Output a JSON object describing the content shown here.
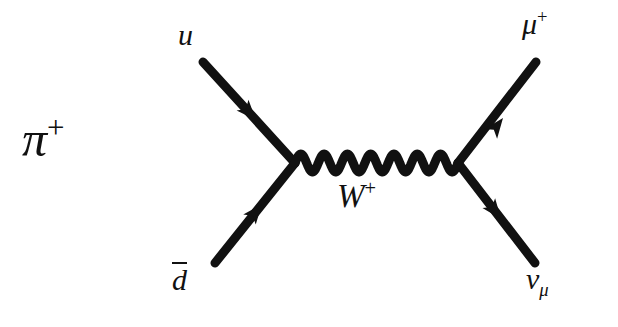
{
  "diagram": {
    "background_color": "#ffffff",
    "stroke_color": "#111111",
    "labels": {
      "pion": {
        "base": "π",
        "superscript": "+"
      },
      "up_quark": {
        "base": "u",
        "superscript": ""
      },
      "anti_down_quark": {
        "base": "d",
        "overline": true
      },
      "w_boson": {
        "base": "W",
        "superscript": "+"
      },
      "antimuon": {
        "base": "μ",
        "superscript": "+"
      },
      "muon_neutrino": {
        "base": "ν",
        "subscript": "μ"
      }
    },
    "vertices": {
      "left": {
        "x": 295,
        "y": 163
      },
      "right": {
        "x": 458,
        "y": 163
      }
    },
    "fermion_lines": [
      {
        "name": "u-quark-line",
        "from": {
          "x": 203,
          "y": 62
        },
        "to": {
          "x": 295,
          "y": 163
        },
        "arrow_direction": "inward",
        "particle": "u"
      },
      {
        "name": "dbar-quark-line",
        "from": {
          "x": 215,
          "y": 263
        },
        "to": {
          "x": 295,
          "y": 163
        },
        "arrow_direction": "inward",
        "particle": "d-bar"
      },
      {
        "name": "antimuon-line",
        "from": {
          "x": 458,
          "y": 163
        },
        "to": {
          "x": 536,
          "y": 62
        },
        "arrow_direction": "outward",
        "particle": "mu+"
      },
      {
        "name": "neutrino-line",
        "from": {
          "x": 458,
          "y": 163
        },
        "to": {
          "x": 535,
          "y": 263
        },
        "arrow_direction": "outward",
        "particle": "nu-mu"
      }
    ],
    "propagator": {
      "name": "w-boson-propagator",
      "style": "wavy",
      "cycles": 7,
      "amplitude": 9,
      "from": {
        "x": 295,
        "y": 163
      },
      "to": {
        "x": 458,
        "y": 163
      }
    }
  }
}
